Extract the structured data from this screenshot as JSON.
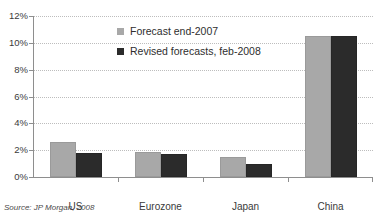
{
  "chart_data": {
    "type": "bar",
    "title": "",
    "subtitle": "",
    "xlabel": "",
    "ylabel": "",
    "categories": [
      "US",
      "Eurozone",
      "Japan",
      "China"
    ],
    "series": [
      {
        "name": "Forecast end-2007",
        "color": "#a8a8a8",
        "values": [
          2.6,
          1.9,
          1.5,
          10.5
        ]
      },
      {
        "name": "Revised forecasts, feb-2008",
        "color": "#2b2b2b",
        "values": [
          1.8,
          1.7,
          1.0,
          10.5
        ]
      }
    ],
    "ylim": [
      0,
      12
    ],
    "yticks": [
      0,
      2,
      4,
      6,
      8,
      10,
      12
    ],
    "ytick_labels": [
      "0%",
      "2%",
      "4%",
      "6%",
      "8%",
      "10%",
      "12%"
    ],
    "grid": true,
    "grid_axis": "y",
    "legend_position": "top-center",
    "annotations": [
      {
        "name": "source",
        "text": "Source: JP Morgan, 2008"
      }
    ]
  },
  "source": {
    "text": "Source: JP Morgan, 2008"
  }
}
